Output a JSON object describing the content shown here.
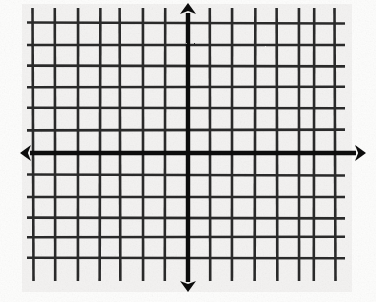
{
  "figure": {
    "medium": "scanned ink drawing on graph paper"
  },
  "colors": {
    "paper": "#f1f0ee",
    "paper_edge": "#fdfdfc",
    "grid_line": "#2b2b2b",
    "axis_line": "#111111",
    "arrow": "#111111"
  },
  "chart_data": {
    "type": "grid",
    "title": "",
    "xlabel": "",
    "ylabel": "",
    "grid": true,
    "legend": "none",
    "origin": {
      "x": 188,
      "y": 153
    },
    "cell_size": {
      "width": 22.5,
      "height": 22.5
    },
    "axes": {
      "x_axis": {
        "name": "x-axis",
        "y": 153,
        "start_x": 20,
        "end_x": 366,
        "arrowheads": [
          "left",
          "right"
        ],
        "stroke_width": 4.4
      },
      "y_axis": {
        "name": "y-axis",
        "x": 188,
        "start_y": 3,
        "end_y": 292,
        "arrowheads": [
          "up",
          "down"
        ],
        "stroke_width": 4.4
      }
    },
    "grid_lines": {
      "vertical_count": 14,
      "horizontal_count": 12,
      "vertical_x": [
        33,
        55,
        78,
        100,
        120,
        143,
        165,
        188,
        210,
        232,
        255,
        277,
        299,
        314,
        335
      ],
      "horizontal_y": [
        23,
        45,
        66,
        87,
        108,
        130,
        153,
        175,
        197,
        218,
        237,
        258
      ],
      "vertical_extent": {
        "top": 8,
        "bottom": 281
      },
      "horizontal_extent": {
        "left": 27,
        "right": 345
      },
      "stroke_width": 2.6
    },
    "quadrant_cells": {
      "left_of_axis": 7,
      "right_of_axis": 7,
      "above_axis": 6,
      "below_axis": 5
    },
    "tick_labels": [],
    "annotations": []
  },
  "elements": {
    "x_axis_label": "x-axis",
    "y_axis_label": "y-axis",
    "left_arrow": "arrow-left",
    "right_arrow": "arrow-right",
    "up_arrow": "arrow-up",
    "down_arrow": "arrow-down",
    "grid_label": "grid"
  }
}
